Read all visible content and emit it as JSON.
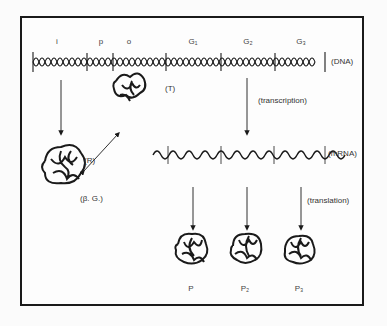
{
  "diagram": {
    "genes": [
      {
        "label": "i",
        "x": 57
      },
      {
        "label": "p",
        "x": 101
      },
      {
        "label": "o",
        "x": 129
      },
      {
        "label": "G₁",
        "x": 193
      },
      {
        "label": "G₂",
        "x": 248
      },
      {
        "label": "G₃",
        "x": 301
      }
    ],
    "labels": {
      "dna": "(DNA)",
      "mrna": "(mRNA)",
      "transcription": "(transcription)",
      "translation": "(translation)",
      "operator_complex": "(T)",
      "repressor": "(R)",
      "beta_g": "(β. G.)"
    },
    "proteins": [
      {
        "label": "P",
        "x": 191
      },
      {
        "label": "P₂",
        "x": 245
      },
      {
        "label": "P₃",
        "x": 299
      }
    ],
    "colors": {
      "ink": "#1a1a1a",
      "background": "#fdfdfd"
    }
  }
}
